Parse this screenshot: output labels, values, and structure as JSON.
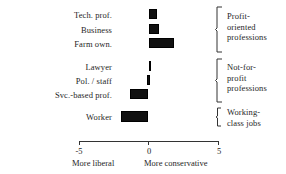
{
  "chart_data": {
    "type": "bar",
    "orientation": "horizontal",
    "title": "",
    "xlabel": "",
    "ylabel": "",
    "xlim": [
      -5,
      5
    ],
    "grid": false,
    "legend": null,
    "zero_reference": 0,
    "axis": {
      "ticks": [
        -5,
        0,
        5
      ],
      "tick_labels": [
        "-5",
        "0",
        "5"
      ],
      "left_caption": "More liberal",
      "right_caption": "More conservative"
    },
    "categories": [
      "Tech. prof.",
      "Business",
      "Farm own.",
      "Lawyer",
      "Pol. / staff",
      "Svc.-based prof.",
      "Worker"
    ],
    "values": [
      0.6,
      0.75,
      1.8,
      0.0,
      0.1,
      -1.3,
      -1.95
    ],
    "bars": [
      {
        "label": "Tech. prof.",
        "start": 0,
        "end": 0.6
      },
      {
        "label": "Business",
        "start": 0,
        "end": 0.75
      },
      {
        "label": "Farm own.",
        "start": 0,
        "end": 1.8
      },
      {
        "label": "Lawyer",
        "start": 0,
        "end": 0.0
      },
      {
        "label": "Pol. / staff",
        "start": -0.1,
        "end": 0.1
      },
      {
        "label": "Svc.-based prof.",
        "start": -1.3,
        "end": 0
      },
      {
        "label": "Worker",
        "start": -1.95,
        "end": 0
      }
    ],
    "groups": [
      {
        "name": "Profit-oriented professions",
        "lines": [
          "Profit-",
          "oriented",
          "professions"
        ],
        "members": [
          "Tech. prof.",
          "Business",
          "Farm own."
        ]
      },
      {
        "name": "Not-for-profit professions",
        "lines": [
          "Not-for-",
          "profit",
          "professions"
        ],
        "members": [
          "Lawyer",
          "Pol. / staff",
          "Svc.-based prof."
        ]
      },
      {
        "name": "Working-class jobs",
        "lines": [
          "Working-",
          "class jobs"
        ],
        "members": [
          "Worker"
        ]
      }
    ],
    "colors": {
      "bar": "#111111",
      "axis": "#333333",
      "text": "#262626",
      "background": "#ffffff"
    }
  }
}
